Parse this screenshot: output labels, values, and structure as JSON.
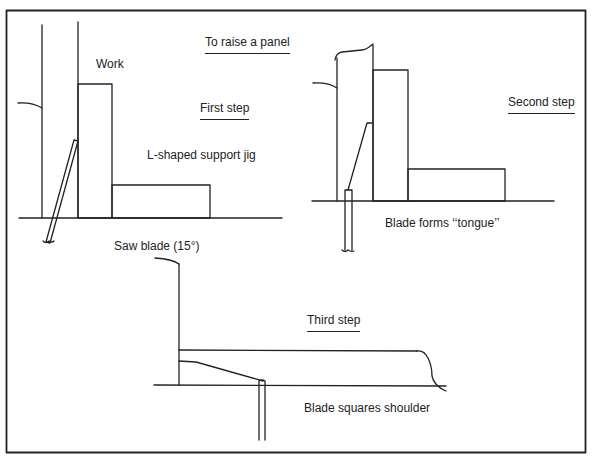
{
  "diagram": {
    "title": "To raise a panel",
    "colors": {
      "line": "#222222",
      "background": "#ffffff"
    },
    "labels": {
      "work": "Work",
      "first_step": "First step",
      "jig": "L-shaped support jig",
      "saw_blade": "Saw blade (15°)",
      "second_step": "Second step",
      "tongue": "Blade forms ‘‘tongue’’",
      "third_step": "Third step",
      "shoulder": "Blade squares shoulder"
    },
    "steps": [
      {
        "name": "First step",
        "description": "Work held upright against L-shaped support jig; saw blade tilted 15°"
      },
      {
        "name": "Second step",
        "description": "Blade forms tongue"
      },
      {
        "name": "Third step",
        "description": "Blade squares shoulder"
      }
    ]
  }
}
